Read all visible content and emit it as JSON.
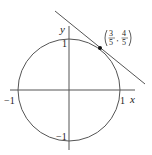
{
  "diagram": {
    "type": "unit-circle-tangent",
    "axes": {
      "x_label": "x",
      "y_label": "y",
      "x_ticks": [
        "−1",
        "1"
      ],
      "y_ticks": [
        "1",
        "−1"
      ]
    },
    "point": {
      "label_x_num": "3",
      "label_x_den": "5",
      "label_y_num": "4",
      "label_y_den": "5",
      "coords": [
        0.6,
        0.8
      ]
    },
    "colors": {
      "line": "#555555",
      "point": "#111111"
    }
  }
}
